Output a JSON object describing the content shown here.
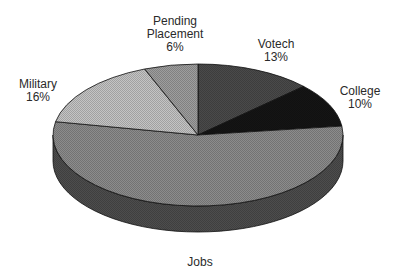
{
  "chart_data": {
    "type": "pie",
    "style": "3d",
    "title": "",
    "start_angle_deg": 0,
    "direction": "clockwise",
    "slices": [
      {
        "name": "Votech",
        "value": 13,
        "label_lines": [
          "Votech"
        ],
        "pct_label": "13%",
        "color": "#4a4a4a",
        "side_color": "#2e2e2e",
        "label_pos": [
          276,
          38
        ]
      },
      {
        "name": "College",
        "value": 10,
        "label_lines": [
          "College"
        ],
        "pct_label": "10%",
        "color": "#151515",
        "side_color": "#0c0c0c",
        "label_pos": [
          360,
          85
        ]
      },
      {
        "name": "Jobs",
        "value": 55,
        "label_lines": [
          "Jobs"
        ],
        "pct_label": "",
        "color": "#8c8c8c",
        "side_color": "#4d4d4d",
        "label_pos": [
          200,
          256
        ]
      },
      {
        "name": "Military",
        "value": 16,
        "label_lines": [
          "Military"
        ],
        "pct_label": "16%",
        "color": "#c4c4c4",
        "side_color": "#7a7a7a",
        "label_pos": [
          38,
          78
        ]
      },
      {
        "name": "Pending Placement",
        "value": 6,
        "label_lines": [
          "Pending",
          "Placement"
        ],
        "pct_label": "6%",
        "color": "#9e9e9e",
        "side_color": "#6a6a6a",
        "label_pos": [
          175,
          15
        ]
      }
    ],
    "geometry": {
      "cx": 198,
      "cy": 135,
      "rx": 145,
      "ry": 71,
      "depth": 26
    },
    "legend": "none"
  }
}
